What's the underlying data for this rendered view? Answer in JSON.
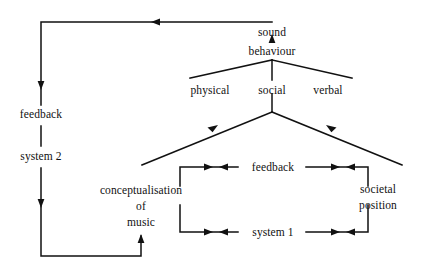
{
  "diagram": {
    "ink_color": "#111111",
    "background": "#ffffff",
    "nodes": {
      "sound": "sound",
      "behaviour": "behaviour",
      "physical": "physical",
      "social": "social",
      "verbal": "verbal",
      "feedback_left": "feedback",
      "system_2": "system 2",
      "conceptualisation_line1": "conceptualisation",
      "conceptualisation_line2": "of",
      "conceptualisation_line3": "music",
      "feedback_inner": "feedback",
      "system_1": "system 1",
      "societal_line1": "societal",
      "societal_line2": "position"
    },
    "edges": [
      {
        "name": "behaviour-to-sound",
        "from": "behaviour",
        "to": "sound",
        "arrow": "up"
      },
      {
        "name": "behaviour-to-physical",
        "from": "behaviour",
        "to": "physical",
        "arrow": "none"
      },
      {
        "name": "behaviour-to-social",
        "from": "behaviour",
        "to": "social",
        "arrow": "none"
      },
      {
        "name": "behaviour-to-verbal",
        "from": "behaviour",
        "to": "verbal",
        "arrow": "none"
      },
      {
        "name": "conceptualisation-to-social",
        "from": "conceptualisation of music",
        "to": "social",
        "arrow": "up-right"
      },
      {
        "name": "societal-position-to-social",
        "from": "societal position",
        "to": "social",
        "arrow": "up-left"
      },
      {
        "name": "feedback-inner-bidirectional",
        "from": "conceptualisation of music",
        "to": "societal position",
        "arrow": "both"
      },
      {
        "name": "system-1-bidirectional",
        "from": "conceptualisation of music",
        "to": "societal position",
        "arrow": "both"
      },
      {
        "name": "sound-to-feedback-system2",
        "from": "sound",
        "to": "feedback / system 2",
        "arrow": "left-then-down"
      },
      {
        "name": "system2-to-conceptualisation",
        "from": "system 2",
        "to": "conceptualisation of music",
        "arrow": "up"
      }
    ]
  }
}
